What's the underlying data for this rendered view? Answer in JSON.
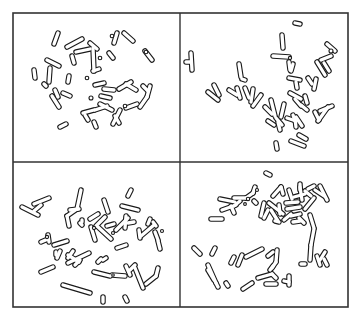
{
  "figure": {
    "frame": {
      "x": 13,
      "y": 13,
      "w": 335,
      "h": 294
    },
    "divider_x": 180,
    "divider_y": 162,
    "colors": {
      "outline": "#1a1a1a",
      "frame": "#333333",
      "background": "#ffffff"
    },
    "stroke_width": 5.5,
    "panels": [
      {
        "id": "top-left",
        "segments": [
          [
            58,
            33,
            54,
            44
          ],
          [
            67,
            47,
            82,
            39
          ],
          [
            76,
            52,
            90,
            49
          ],
          [
            90,
            43,
            97,
            49
          ],
          [
            93,
            48,
            94,
            71
          ],
          [
            93,
            71,
            99,
            69
          ],
          [
            117,
            33,
            114,
            43
          ],
          [
            124,
            33,
            133,
            41
          ],
          [
            109,
            53,
            113,
            58
          ],
          [
            145,
            51,
            152,
            60
          ],
          [
            47,
            60,
            59,
            66
          ],
          [
            72,
            56,
            74,
            63
          ],
          [
            34,
            70,
            35,
            78
          ],
          [
            50,
            68,
            49,
            82
          ],
          [
            46,
            86,
            44,
            84
          ],
          [
            69,
            76,
            68,
            82
          ],
          [
            55,
            90,
            58,
            97
          ],
          [
            63,
            93,
            70,
            96
          ],
          [
            95,
            85,
            104,
            83
          ],
          [
            104,
            89,
            114,
            90
          ],
          [
            119,
            89,
            131,
            82
          ],
          [
            126,
            84,
            136,
            90
          ],
          [
            143,
            86,
            148,
            91
          ],
          [
            150,
            86,
            147,
            97
          ],
          [
            147,
            97,
            140,
            107
          ],
          [
            52,
            96,
            59,
            107
          ],
          [
            83,
            113,
            94,
            110
          ],
          [
            95,
            110,
            107,
            106
          ],
          [
            100,
            104,
            112,
            110
          ],
          [
            126,
            108,
            137,
            104
          ],
          [
            115,
            116,
            119,
            123
          ],
          [
            120,
            110,
            113,
            124
          ],
          [
            85,
            115,
            88,
            120
          ],
          [
            66,
            124,
            60,
            127
          ],
          [
            94,
            122,
            96,
            127
          ],
          [
            101,
            96,
            110,
            98
          ]
        ],
        "dots": [
          [
            112,
            36,
            1.8
          ],
          [
            87,
            78,
            1.8
          ],
          [
            100,
            58,
            1.8
          ],
          [
            91,
            98,
            2
          ],
          [
            125,
            106,
            1.8
          ],
          [
            146,
            52,
            1.8
          ]
        ]
      },
      {
        "id": "top-right",
        "segments": [
          [
            191,
            53,
            192,
            70
          ],
          [
            186,
            62,
            191,
            62
          ],
          [
            239,
            64,
            241,
            77
          ],
          [
            242,
            79,
            245,
            80
          ],
          [
            208,
            92,
            218,
            100
          ],
          [
            214,
            85,
            219,
            95
          ],
          [
            229,
            90,
            237,
            95
          ],
          [
            237,
            88,
            240,
            98
          ],
          [
            245,
            88,
            249,
            98
          ],
          [
            253,
            89,
            251,
            102
          ],
          [
            261,
            95,
            253,
            106
          ],
          [
            265,
            107,
            272,
            114
          ],
          [
            271,
            100,
            275,
            116
          ],
          [
            284,
            104,
            281,
            117
          ],
          [
            276,
            118,
            282,
            125
          ],
          [
            278,
            122,
            280,
            130
          ],
          [
            268,
            121,
            274,
            125
          ],
          [
            287,
            118,
            296,
            121
          ],
          [
            293,
            115,
            295,
            121
          ],
          [
            282,
            35,
            283,
            48
          ],
          [
            295,
            23,
            300,
            24
          ],
          [
            273,
            56,
            289,
            57
          ],
          [
            289,
            62,
            290,
            70
          ],
          [
            293,
            64,
            291,
            71
          ],
          [
            289,
            78,
            300,
            80
          ],
          [
            296,
            82,
            297,
            88
          ],
          [
            290,
            93,
            301,
            99
          ],
          [
            295,
            99,
            301,
            106
          ],
          [
            301,
            105,
            307,
            110
          ],
          [
            305,
            96,
            307,
            103
          ],
          [
            308,
            78,
            312,
            84
          ],
          [
            316,
            79,
            314,
            89
          ],
          [
            327,
            44,
            335,
            51
          ],
          [
            321,
            60,
            331,
            56
          ],
          [
            324,
            63,
            329,
            71
          ],
          [
            317,
            62,
            325,
            75
          ],
          [
            315,
            112,
            319,
            120
          ],
          [
            320,
            111,
            332,
            106
          ],
          [
            328,
            107,
            318,
            121
          ],
          [
            291,
            141,
            304,
            146
          ],
          [
            276,
            143,
            277,
            149
          ],
          [
            299,
            135,
            306,
            139
          ],
          [
            296,
            117,
            302,
            126
          ],
          [
            295,
            118,
            296,
            127
          ]
        ],
        "dots": [
          [
            290,
            58,
            1.6
          ],
          [
            331,
            51,
            2
          ]
        ]
      },
      {
        "id": "bottom-left",
        "segments": [
          [
            22,
            207,
            38,
            215
          ],
          [
            34,
            204,
            49,
            198
          ],
          [
            41,
            205,
            34,
            211
          ],
          [
            81,
            190,
            77,
            209
          ],
          [
            77,
            209,
            67,
            216
          ],
          [
            70,
            210,
            79,
            209
          ],
          [
            67,
            216,
            69,
            226
          ],
          [
            82,
            225,
            80,
            223
          ],
          [
            90,
            219,
            98,
            214
          ],
          [
            82,
            220,
            82,
            222
          ],
          [
            104,
            200,
            108,
            212
          ],
          [
            131,
            190,
            128,
            196
          ],
          [
            122,
            206,
            138,
            210
          ],
          [
            96,
            226,
            105,
            217
          ],
          [
            91,
            227,
            95,
            240
          ],
          [
            98,
            227,
            111,
            239
          ],
          [
            107,
            226,
            114,
            224
          ],
          [
            116,
            230,
            128,
            218
          ],
          [
            126,
            216,
            125,
            228
          ],
          [
            128,
            223,
            134,
            222
          ],
          [
            139,
            230,
            140,
            238
          ],
          [
            150,
            219,
            148,
            224
          ],
          [
            41,
            242,
            48,
            239
          ],
          [
            48,
            235,
            49,
            242
          ],
          [
            54,
            245,
            67,
            241
          ],
          [
            56,
            252,
            56,
            255
          ],
          [
            60,
            251,
            57,
            258
          ],
          [
            68,
            258,
            73,
            251
          ],
          [
            68,
            263,
            89,
            253
          ],
          [
            68,
            255,
            79,
            262
          ],
          [
            75,
            265,
            80,
            260
          ],
          [
            41,
            272,
            53,
            267
          ],
          [
            117,
            248,
            126,
            245
          ],
          [
            141,
            236,
            154,
            225
          ],
          [
            153,
            222,
            156,
            226
          ],
          [
            155,
            232,
            158,
            240
          ],
          [
            158,
            241,
            160,
            249
          ],
          [
            98,
            262,
            101,
            259
          ],
          [
            103,
            260,
            106,
            258
          ],
          [
            94,
            272,
            110,
            276
          ],
          [
            112,
            275,
            125,
            276
          ],
          [
            126,
            266,
            130,
            275
          ],
          [
            130,
            270,
            135,
            265
          ],
          [
            135,
            268,
            143,
            288
          ],
          [
            146,
            284,
            156,
            276
          ],
          [
            156,
            276,
            158,
            268
          ],
          [
            63,
            285,
            90,
            293
          ],
          [
            103,
            297,
            103,
            302
          ],
          [
            125,
            297,
            127,
            301
          ]
        ],
        "dots": [
          [
            94,
            228,
            1.6
          ],
          [
            113,
            233,
            1.5
          ],
          [
            113,
            275,
            1.3
          ],
          [
            162,
            231,
            1.5
          ],
          [
            47,
            237,
            1.6
          ]
        ]
      },
      {
        "id": "bottom-right",
        "segments": [
          [
            266,
            173,
            270,
            175
          ],
          [
            220,
            199,
            235,
            202
          ],
          [
            234,
            198,
            247,
            198
          ],
          [
            246,
            198,
            253,
            193
          ],
          [
            253,
            193,
            255,
            187
          ],
          [
            222,
            210,
            236,
            205
          ],
          [
            234,
            206,
            240,
            201
          ],
          [
            234,
            213,
            231,
            206
          ],
          [
            211,
            219,
            222,
            219
          ],
          [
            256,
            203,
            254,
            201
          ],
          [
            264,
            203,
            261,
            216
          ],
          [
            264,
            218,
            268,
            210
          ],
          [
            269,
            203,
            283,
            214
          ],
          [
            279,
            205,
            280,
            214
          ],
          [
            271,
            210,
            278,
            221
          ],
          [
            275,
            221,
            279,
            222
          ],
          [
            273,
            196,
            281,
            187
          ],
          [
            281,
            187,
            283,
            194
          ],
          [
            289,
            190,
            292,
            199
          ],
          [
            294,
            197,
            305,
            194
          ],
          [
            300,
            187,
            302,
            200
          ],
          [
            300,
            190,
            300,
            184
          ],
          [
            305,
            191,
            311,
            196
          ],
          [
            315,
            190,
            324,
            196
          ],
          [
            320,
            186,
            327,
            200
          ],
          [
            286,
            203,
            298,
            202
          ],
          [
            287,
            209,
            300,
            207
          ],
          [
            305,
            209,
            314,
            198
          ],
          [
            308,
            189,
            314,
            186
          ],
          [
            284,
            220,
            291,
            214
          ],
          [
            291,
            216,
            300,
            214
          ],
          [
            299,
            218,
            304,
            223
          ],
          [
            310,
            215,
            314,
            228
          ],
          [
            293,
            222,
            300,
            221
          ],
          [
            314,
            229,
            311,
            245
          ],
          [
            311,
            245,
            310,
            260
          ],
          [
            317,
            256,
            320,
            265
          ],
          [
            320,
            260,
            325,
            252
          ],
          [
            324,
            259,
            327,
            265
          ],
          [
            301,
            264,
            305,
            264
          ],
          [
            194,
            248,
            200,
            254
          ],
          [
            212,
            254,
            215,
            248
          ],
          [
            208,
            265,
            216,
            283
          ],
          [
            216,
            283,
            218,
            287
          ],
          [
            208,
            270,
            214,
            280
          ],
          [
            231,
            263,
            234,
            257
          ],
          [
            238,
            265,
            242,
            255
          ],
          [
            246,
            257,
            262,
            249
          ],
          [
            268,
            256,
            273,
            252
          ],
          [
            277,
            250,
            276,
            262
          ],
          [
            276,
            262,
            272,
            268
          ],
          [
            258,
            278,
            272,
            274
          ],
          [
            273,
            266,
            270,
            270
          ],
          [
            272,
            274,
            276,
            278
          ],
          [
            284,
            281,
            289,
            282
          ],
          [
            289,
            276,
            289,
            285
          ],
          [
            226,
            283,
            228,
            286
          ],
          [
            243,
            289,
            252,
            283
          ],
          [
            266,
            284,
            276,
            284
          ]
        ],
        "dots": [
          [
            248,
            199,
            1.7
          ],
          [
            245,
            204,
            1.4
          ],
          [
            257,
            190,
            1.5
          ]
        ]
      }
    ]
  }
}
